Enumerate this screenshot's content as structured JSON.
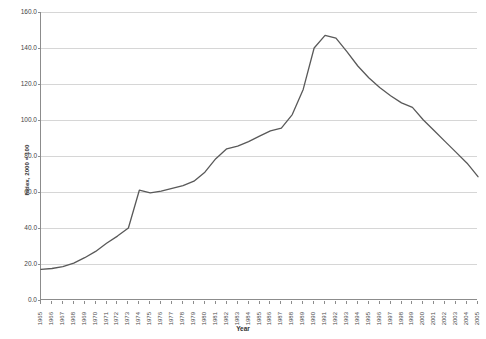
{
  "chart_data": {
    "type": "line",
    "title": "",
    "xlabel": "Year",
    "ylabel": "Index, 2000 = 100",
    "xlim": [
      1965,
      2005
    ],
    "ylim": [
      0,
      160
    ],
    "ytick_step": 20,
    "ytick_labels": [
      "0.0",
      "20.0",
      "40.0",
      "60.0",
      "80.0",
      "100.0",
      "120.0",
      "140.0",
      "160.0"
    ],
    "ytick_values": [
      0,
      20,
      40,
      60,
      80,
      100,
      120,
      140,
      160
    ],
    "grid": true,
    "legend": "none",
    "line_color": "#595959",
    "categories": [
      "1965",
      "1966",
      "1967",
      "1968",
      "1969",
      "1970",
      "1971",
      "1972",
      "1973",
      "1974",
      "1975",
      "1976",
      "1977",
      "1978",
      "1979",
      "1980",
      "1981",
      "1982",
      "1983",
      "1984",
      "1985",
      "1986",
      "1987",
      "1988",
      "1989",
      "1990",
      "1991",
      "1992",
      "1993",
      "1994",
      "1995",
      "1996",
      "1997",
      "1998",
      "1999",
      "2000",
      "2001",
      "2002",
      "2003",
      "2004",
      "2005"
    ],
    "series": [
      {
        "name": "Index",
        "values": [
          17.0,
          17.5,
          18.5,
          20.5,
          23.5,
          27.0,
          31.5,
          35.5,
          40.0,
          61.0,
          59.5,
          60.5,
          62.0,
          63.5,
          66.0,
          71.0,
          78.5,
          84.0,
          85.5,
          88.0,
          91.0,
          94.0,
          95.5,
          103.0,
          117.0,
          140.0,
          147.0,
          145.5,
          138.0,
          130.0,
          123.5,
          118.0,
          113.5,
          109.5,
          107.0,
          100.0,
          94.0,
          88.0,
          82.0,
          76.0,
          68.5
        ]
      }
    ]
  }
}
